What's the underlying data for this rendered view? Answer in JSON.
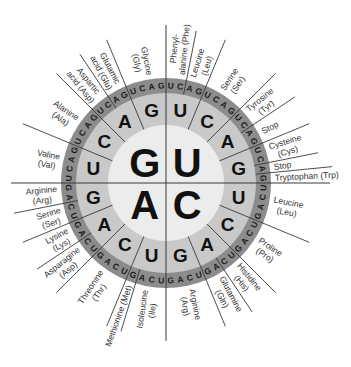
{
  "diagram": {
    "colors": {
      "outer_ring": "#8c8c8c",
      "middle_ring": "#c9c9c9",
      "inner_circle": "#ececec",
      "lines": "#3a3a3a",
      "label_text": "#333333"
    },
    "first_letters": [
      {
        "letter": "U",
        "quadrant": "top-right"
      },
      {
        "letter": "C",
        "quadrant": "bottom-right"
      },
      {
        "letter": "A",
        "quadrant": "bottom-left"
      },
      {
        "letter": "G",
        "quadrant": "top-left"
      }
    ],
    "second_letters": [
      "U",
      "C",
      "A",
      "G"
    ],
    "third_letters": [
      "U",
      "C",
      "A",
      "G"
    ],
    "amino_acids": [
      {
        "codons": "UUU,UUC",
        "lines": [
          "Phenyl-",
          "alanine (Phe)"
        ]
      },
      {
        "codons": "UUA,UUG",
        "lines": [
          "Leucine",
          "(Leu)"
        ]
      },
      {
        "codons": "UCU,UCC,UCA,UCG",
        "lines": [
          "Serine",
          "(Ser)"
        ]
      },
      {
        "codons": "UAU,UAC",
        "lines": [
          "Tyrosine",
          "(Tyr)"
        ]
      },
      {
        "codons": "UAA,UAG",
        "lines": [
          "Stop"
        ]
      },
      {
        "codons": "UGU,UGC",
        "lines": [
          "Cysteine",
          "(Cys)"
        ]
      },
      {
        "codons": "UGA",
        "lines": [
          "Stop"
        ]
      },
      {
        "codons": "UGG",
        "lines": [
          "Tryptophan (Trp)"
        ]
      },
      {
        "codons": "CUU,CUC,CUA,CUG",
        "lines": [
          "Leucine",
          "(Leu)"
        ]
      },
      {
        "codons": "CCU,CCC,CCA,CCG",
        "lines": [
          "Proline",
          "(Pro)"
        ]
      },
      {
        "codons": "CAU,CAC",
        "lines": [
          "Histidine",
          "(His)"
        ]
      },
      {
        "codons": "CAA,CAG",
        "lines": [
          "Glutamine",
          "(Gln)"
        ]
      },
      {
        "codons": "CGU,CGC,CGA,CGG",
        "lines": [
          "Arginine",
          "(Arg)"
        ]
      },
      {
        "codons": "AUU,AUC,AUA",
        "lines": [
          "Isoleucine",
          "(Ile)"
        ]
      },
      {
        "codons": "AUG",
        "lines": [
          "Methionine (Met)"
        ]
      },
      {
        "codons": "ACU,ACC,ACA,ACG",
        "lines": [
          "Threonine",
          "(Thr)"
        ]
      },
      {
        "codons": "AAU,AAC",
        "lines": [
          "Asparagine",
          "(Asp)"
        ]
      },
      {
        "codons": "AAA,AAG",
        "lines": [
          "Lysine",
          "(Lys)"
        ]
      },
      {
        "codons": "AGU,AGC",
        "lines": [
          "Serine",
          "(Ser)"
        ]
      },
      {
        "codons": "AGA,AGG",
        "lines": [
          "Arginine",
          "(Arg)"
        ]
      },
      {
        "codons": "GUU,GUC,GUA,GUG",
        "lines": [
          "Valine",
          "(Val)"
        ]
      },
      {
        "codons": "GCU,GCC,GCA,GCG",
        "lines": [
          "Alanine",
          "(Ala)"
        ]
      },
      {
        "codons": "GAU,GAC",
        "lines": [
          "Aspartic",
          "acid (Asp)"
        ]
      },
      {
        "codons": "GAA,GAG",
        "lines": [
          "Glutamic",
          "acid (Glu)"
        ]
      },
      {
        "codons": "GGU,GGC,GGA,GGG",
        "lines": [
          "Glycine",
          "(Gly)"
        ]
      }
    ]
  }
}
